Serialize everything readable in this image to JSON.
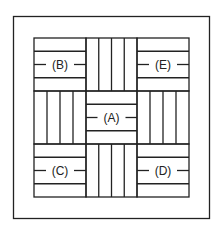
{
  "diagram": {
    "type": "parquet-tile-pattern",
    "outer_frame": {
      "x": 13,
      "y": 16,
      "w": 197,
      "h": 203
    },
    "grid": {
      "x": [
        34,
        86,
        137,
        189
      ],
      "y": [
        38,
        91,
        144,
        197
      ]
    },
    "stroke_color": "#222222",
    "cells": [
      {
        "row": 0,
        "col": 0,
        "orientation": "horizontal",
        "label": "(B)"
      },
      {
        "row": 0,
        "col": 1,
        "orientation": "vertical",
        "label": ""
      },
      {
        "row": 0,
        "col": 2,
        "orientation": "horizontal",
        "label": "(E)"
      },
      {
        "row": 1,
        "col": 0,
        "orientation": "vertical",
        "label": ""
      },
      {
        "row": 1,
        "col": 1,
        "orientation": "horizontal",
        "label": "(A)"
      },
      {
        "row": 1,
        "col": 2,
        "orientation": "vertical",
        "label": ""
      },
      {
        "row": 2,
        "col": 0,
        "orientation": "horizontal",
        "label": "(C)"
      },
      {
        "row": 2,
        "col": 1,
        "orientation": "vertical",
        "label": ""
      },
      {
        "row": 2,
        "col": 2,
        "orientation": "horizontal",
        "label": "(D)"
      }
    ]
  },
  "labels": {
    "a": "(A)",
    "b": "(B)",
    "c": "(C)",
    "d": "(D)",
    "e": "(E)"
  }
}
